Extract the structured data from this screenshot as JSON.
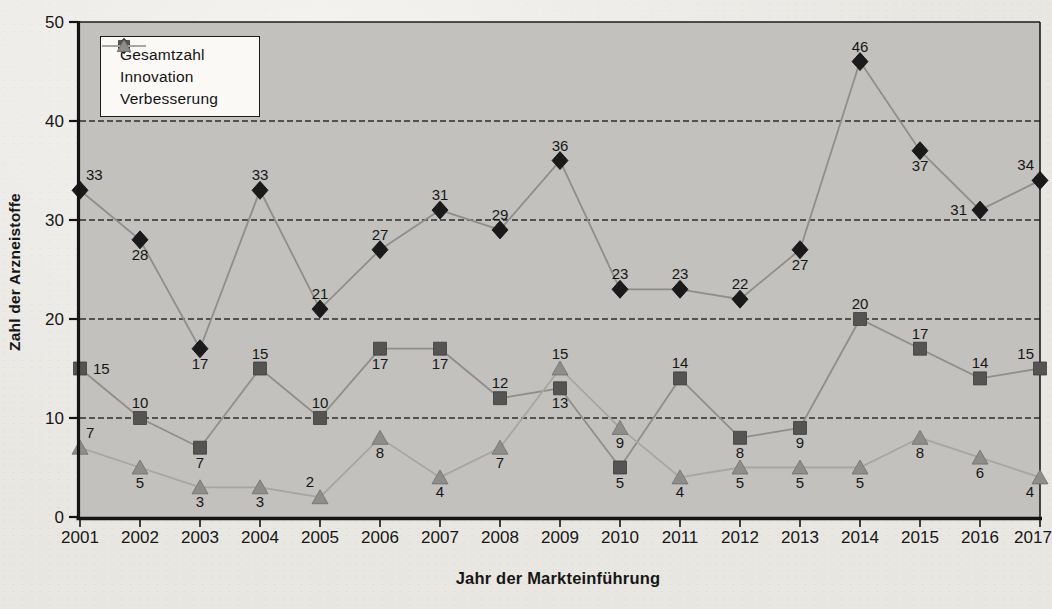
{
  "figure": {
    "kind": "scanned book line chart",
    "paper_color": "#e9e7e2",
    "plot_background": "#c2c1be",
    "gridline_color": "#2e2e2e",
    "axis_color": "#141414",
    "text_color": "#161616"
  },
  "chart_data": {
    "type": "line",
    "title": "",
    "xlabel": "Jahr der Markteinführung",
    "ylabel": "Zahl der Arzneistoffe",
    "ylim": [
      0,
      50
    ],
    "yticks": [
      0,
      10,
      20,
      30,
      40,
      50
    ],
    "grid": "horizontal dashed at 10,20,30,40",
    "legend_position": "inside top-left",
    "point_labels": "shown",
    "categories": [
      "2001",
      "2002",
      "2003",
      "2004",
      "2005",
      "2006",
      "2007",
      "2008",
      "2009",
      "2010",
      "2011",
      "2012",
      "2013",
      "2014",
      "2015",
      "2016",
      "2017"
    ],
    "series": [
      {
        "name": "Gesamtzahl",
        "marker": "diamond",
        "marker_color": "#1a1a1a",
        "marker_edge": "#0d0d0d",
        "line_color": "#8f8e8b",
        "values": [
          33,
          28,
          17,
          33,
          21,
          27,
          31,
          29,
          36,
          23,
          23,
          22,
          27,
          46,
          37,
          31,
          34
        ],
        "label_pos": [
          "ar",
          "b",
          "b",
          "a",
          "a",
          "a",
          "a",
          "a",
          "a",
          "a",
          "a",
          "a",
          "b",
          "a",
          "b",
          "l",
          "al"
        ]
      },
      {
        "name": "Innovation",
        "marker": "square",
        "marker_color": "#555453",
        "marker_edge": "#3e3d3c",
        "line_color": "#8f8e8b",
        "values": [
          15,
          10,
          7,
          15,
          10,
          17,
          17,
          12,
          13,
          5,
          14,
          8,
          9,
          20,
          17,
          14,
          15
        ],
        "label_pos": [
          "r",
          "a",
          "b",
          "a",
          "a",
          "b",
          "b",
          "a",
          "b",
          "b",
          "a",
          "b",
          "b",
          "a",
          "a",
          "a",
          "al"
        ]
      },
      {
        "name": "Verbesserung",
        "marker": "triangle",
        "marker_color": "#8e8d89",
        "marker_edge": "#6f6e6b",
        "line_color": "#a7a6a2",
        "values": [
          7,
          5,
          3,
          3,
          2,
          8,
          4,
          7,
          15,
          9,
          4,
          5,
          5,
          5,
          8,
          6,
          4
        ],
        "label_pos": [
          "ar",
          "b",
          "b",
          "b",
          "al",
          "b",
          "b",
          "b",
          "a",
          "b",
          "b",
          "b",
          "b",
          "b",
          "b",
          "b",
          "bl"
        ]
      }
    ]
  }
}
